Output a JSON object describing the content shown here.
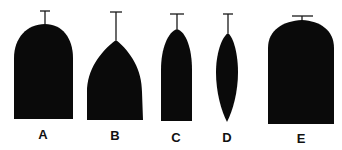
{
  "figure": {
    "fill_color": "#0a0a0a",
    "background_color": "#ffffff",
    "items": [
      {
        "label": "A",
        "shape": "rounded-arch"
      },
      {
        "label": "B",
        "shape": "pointed-gothic-arch"
      },
      {
        "label": "C",
        "shape": "narrow-pointed-arch"
      },
      {
        "label": "D",
        "shape": "lens-spindle"
      },
      {
        "label": "E",
        "shape": "broad-flat-arch"
      }
    ]
  }
}
